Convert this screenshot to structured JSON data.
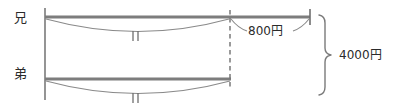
{
  "diagram": {
    "type": "tape-bar-comparison",
    "rows": [
      {
        "id": "ani",
        "label": "兄",
        "bar": {
          "x_start": 45,
          "x_end": 310,
          "y": 17
        },
        "equal_segment": {
          "x_start": 45,
          "x_end": 230,
          "tick": "‖"
        },
        "extra_segment": {
          "x_start": 230,
          "x_end": 310,
          "value_label": "800円"
        }
      },
      {
        "id": "otouto",
        "label": "弟",
        "bar": {
          "x_start": 45,
          "x_end": 230,
          "y": 79
        },
        "equal_segment": {
          "x_start": 45,
          "x_end": 230,
          "tick": "‖"
        }
      }
    ],
    "annotations": {
      "difference_label": "800円",
      "total_label": "4000円"
    },
    "divider": {
      "type": "dashed-vertical",
      "x": 230,
      "y_top": 10,
      "y_bottom": 88
    },
    "left_axis": {
      "type": "solid-vertical",
      "x": 45,
      "y_top": 8,
      "y_bottom": 100
    },
    "brace": {
      "orientation": "right",
      "y_top": 15,
      "y_bottom": 95,
      "x": 324
    },
    "colors": {
      "bar": "#7d7d7d",
      "arc": "#8a8a8a",
      "line": "#6f6f6f",
      "text": "#2a2a2a",
      "background": "#ffffff"
    }
  }
}
